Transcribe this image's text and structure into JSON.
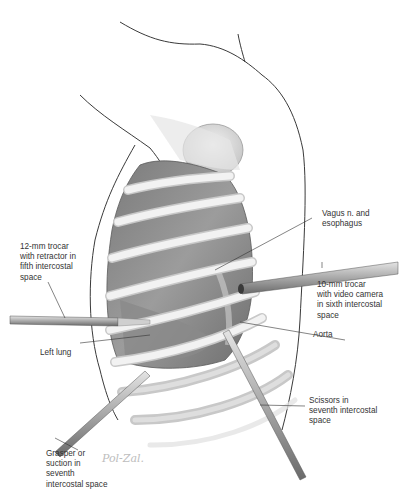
{
  "figure": {
    "signature": "Pol-Zal."
  },
  "labels": {
    "trocar_12mm": "12-mm trocar\nwith retractor in\nfifth intercostal\nspace",
    "vagus": "Vagus n. and\nesophagus",
    "trocar_10mm": "10-mm trocar\nwith video camera\nin sixth intercostal\nspace",
    "aorta": "Aorta",
    "left_lung": "Left lung",
    "scissors": "Scissors in\nseventh intercostal\nspace",
    "grasper": "Grasper or\nsuction in\nseventh\nintercostal space"
  },
  "colors": {
    "ink": "#333333",
    "outline": "#3a3a3a",
    "cavity": "#8c8c8c",
    "rib": "#ececec",
    "instrument": "#b5b5b5"
  }
}
